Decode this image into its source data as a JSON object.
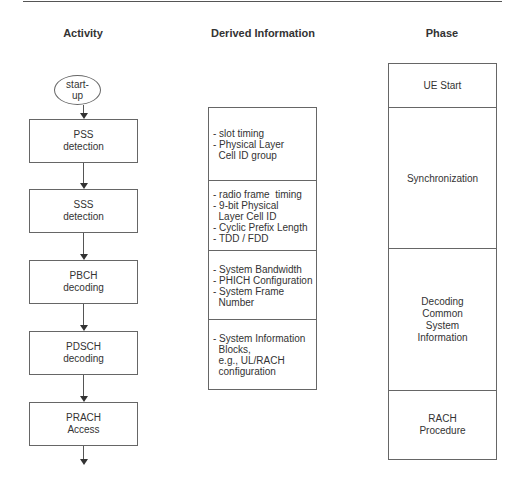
{
  "headers": {
    "activity": "Activity",
    "derived": "Derived Information",
    "phase": "Phase"
  },
  "activity": {
    "start": "start-\nup",
    "steps": [
      "PSS\ndetection",
      "SSS\ndetection",
      "PBCH\ndecoding",
      "PDSCH\ndecoding",
      "PRACH\nAccess"
    ]
  },
  "derived": [
    "- slot timing\n- Physical Layer\n  Cell ID group",
    "- radio frame  timing\n- 9-bit Physical\n  Layer Cell ID\n- Cyclic Prefix Length\n- TDD / FDD",
    "- System Bandwidth\n- PHICH Configuration\n- System Frame\n  Number",
    "- System Information\n  Blocks,\n  e.g., UL/RACH\n  configuration"
  ],
  "phases": [
    "UE Start",
    "Synchronization",
    "Decoding\nCommon\nSystem\nInformation",
    "RACH\nProcedure"
  ],
  "colors": {
    "line": "#666666",
    "text": "#333333",
    "background": "#ffffff"
  }
}
